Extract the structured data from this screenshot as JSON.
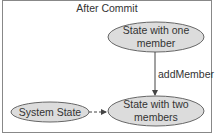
{
  "diagram": {
    "title": "After Commit",
    "nodes": [
      {
        "id": "one",
        "line1": "State with one",
        "line2": "member"
      },
      {
        "id": "two",
        "line1": "State with two",
        "line2": "members"
      },
      {
        "id": "sys",
        "line1": "System State"
      }
    ],
    "edges": [
      {
        "from": "one",
        "to": "two",
        "label": "addMember",
        "style": "solid"
      },
      {
        "from": "sys",
        "to": "two",
        "label": "",
        "style": "dashed"
      }
    ],
    "colors": {
      "node_fill": "#dcdcdc",
      "node_stroke": "#666666",
      "frame": "#888888",
      "text": "#333333"
    }
  }
}
